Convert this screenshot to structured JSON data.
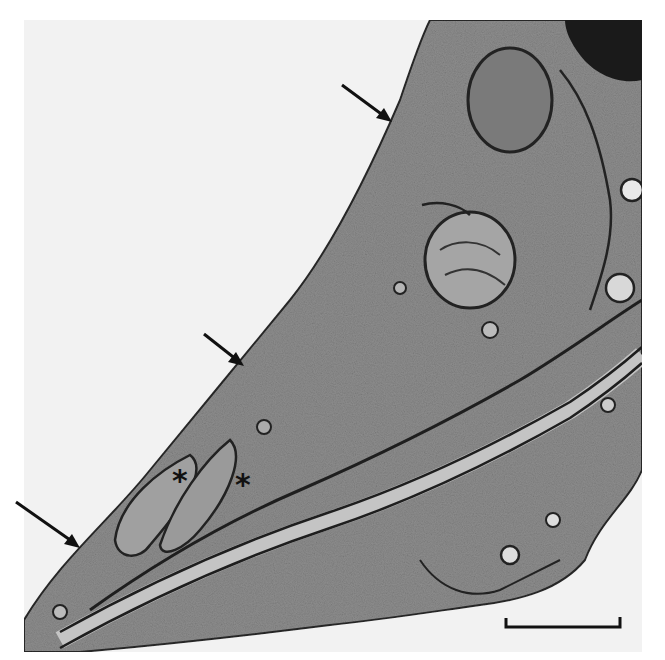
{
  "figure": {
    "type": "transmission electron micrograph",
    "background_color": "#f4f4f4",
    "cytoplasm_color": "#8c8c8c",
    "membrane_color": "#1e1e1e",
    "lamina_color": "#c2c2c2"
  },
  "annotations": {
    "arrows": [
      {
        "id": "arrow-1",
        "tail": [
          342,
          85
        ],
        "head": [
          392,
          122
        ]
      },
      {
        "id": "arrow-2",
        "tail": [
          204,
          334
        ],
        "head": [
          244,
          366
        ]
      },
      {
        "id": "arrow-3",
        "tail": [
          16,
          502
        ],
        "head": [
          80,
          548
        ]
      }
    ],
    "asterisks": [
      {
        "id": "asterisk-1",
        "symbol": "*",
        "x": 172,
        "y": 468
      },
      {
        "id": "asterisk-2",
        "symbol": "*",
        "x": 235,
        "y": 472
      }
    ],
    "scale_bar": {
      "label": "",
      "x1": 506,
      "x2": 620,
      "y": 627
    }
  }
}
